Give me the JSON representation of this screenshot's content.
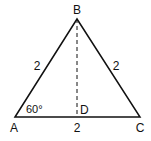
{
  "diagram": {
    "vertices": {
      "A": {
        "label": "A",
        "x": 15,
        "y": 117
      },
      "B": {
        "label": "B",
        "x": 77,
        "y": 19
      },
      "C": {
        "label": "C",
        "x": 140,
        "y": 117
      },
      "D": {
        "label": "D",
        "x": 77,
        "y": 117
      }
    },
    "side_labels": {
      "AB": "2",
      "BC": "2",
      "AC": "2"
    },
    "angle_label": "60°",
    "colors": {
      "stroke": "#111111",
      "background": "#ffffff"
    }
  }
}
